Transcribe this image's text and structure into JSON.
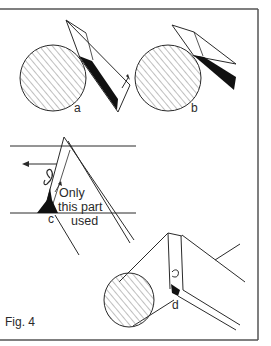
{
  "figure": {
    "caption": "Fig. 4",
    "panels": [
      {
        "id": "a",
        "label": "a",
        "description": "Tool held tangent to round bar, heavy cut, thick shaving"
      },
      {
        "id": "b",
        "label": "b",
        "description": "Tool held more steeply, thinner shaving"
      },
      {
        "id": "c",
        "label": "c",
        "description": "Tool edge on flat work, curl lifting, direction arrow"
      },
      {
        "id": "d",
        "label": "d",
        "description": "Tool on cylinder in perspective"
      }
    ],
    "annotation": {
      "line1": "Only",
      "line2": "this part",
      "line3": "used"
    }
  },
  "colors": {
    "ink": "#2a2a2a",
    "hatch": "#8a8a8a",
    "frame": "#555555",
    "background": "#ffffff"
  }
}
